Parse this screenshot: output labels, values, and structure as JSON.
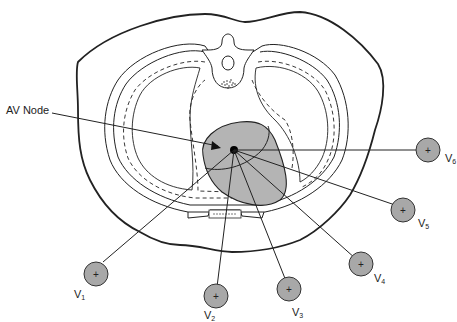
{
  "diagram": {
    "annotation": {
      "text": "AV Node"
    },
    "colors": {
      "heart_fill": "#b4b4b4",
      "electrode_fill": "#a8a8a8",
      "line": "#222222"
    },
    "electrodes": [
      {
        "id": "V1",
        "letter": "V",
        "sub": "1",
        "symbol": "+"
      },
      {
        "id": "V2",
        "letter": "V",
        "sub": "2",
        "symbol": "+"
      },
      {
        "id": "V3",
        "letter": "V",
        "sub": "3",
        "symbol": "+"
      },
      {
        "id": "V4",
        "letter": "V",
        "sub": "4",
        "symbol": "+"
      },
      {
        "id": "V5",
        "letter": "V",
        "sub": "5",
        "symbol": "+"
      },
      {
        "id": "V6",
        "letter": "V",
        "sub": "6",
        "symbol": "+"
      }
    ]
  }
}
